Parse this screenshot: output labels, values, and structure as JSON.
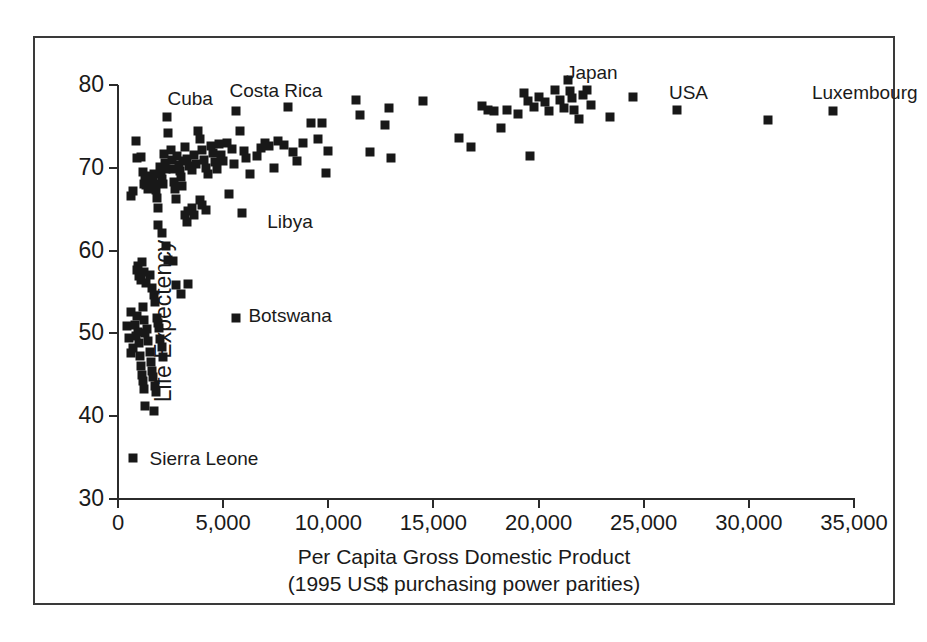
{
  "chart_data": {
    "type": "scatter",
    "title": "",
    "xlabel": "Per Capita Gross Domestic Product",
    "xlabel_sub": "(1995 US$ purchasing power parities)",
    "ylabel": "Life Expectency",
    "xlim": [
      0,
      35000
    ],
    "ylim": [
      30,
      80
    ],
    "xticks": [
      0,
      5000,
      10000,
      15000,
      20000,
      25000,
      30000,
      35000
    ],
    "xtick_labels": [
      "0",
      "5,000",
      "10,000",
      "15,000",
      "20,000",
      "25,000",
      "30,000",
      "35,000"
    ],
    "yticks": [
      30,
      40,
      50,
      60,
      70,
      80
    ],
    "ytick_labels": [
      "30",
      "40",
      "50",
      "60",
      "70",
      "80"
    ],
    "grid": false,
    "legend": false,
    "marker": "square",
    "marker_color": "#181818",
    "annotations": [
      {
        "text": "Japan",
        "x": 21300,
        "y": 81.6
      },
      {
        "text": "Cuba",
        "x": 2350,
        "y": 78.4
      },
      {
        "text": "Costa Rica",
        "x": 5300,
        "y": 79.4
      },
      {
        "text": "USA",
        "x": 26200,
        "y": 79.1
      },
      {
        "text": "Luxembourg",
        "x": 33000,
        "y": 79.1
      },
      {
        "text": "Libya",
        "x": 7100,
        "y": 63.6
      },
      {
        "text": "Botswana",
        "x": 6200,
        "y": 52.2
      },
      {
        "text": "Sierra Leone",
        "x": 1500,
        "y": 35.0
      }
    ],
    "points": [
      [
        600,
        52.6
      ],
      [
        450,
        50.9
      ],
      [
        500,
        49.4
      ],
      [
        700,
        48.2
      ],
      [
        600,
        47.6
      ],
      [
        800,
        51.0
      ],
      [
        850,
        49.7
      ],
      [
        900,
        52.1
      ],
      [
        950,
        50.2
      ],
      [
        1000,
        48.9
      ],
      [
        1050,
        47.3
      ],
      [
        1100,
        46.1
      ],
      [
        1150,
        45.0
      ],
      [
        1200,
        44.2
      ],
      [
        1250,
        43.3
      ],
      [
        1300,
        41.2
      ],
      [
        1700,
        40.6
      ],
      [
        700,
        35.0
      ],
      [
        900,
        57.6
      ],
      [
        950,
        58.1
      ],
      [
        1000,
        56.9
      ],
      [
        1050,
        57.3
      ],
      [
        1100,
        56.4
      ],
      [
        1150,
        58.6
      ],
      [
        1250,
        57.4
      ],
      [
        1350,
        56.1
      ],
      [
        1500,
        57.0
      ],
      [
        1600,
        55.5
      ],
      [
        1700,
        54.6
      ],
      [
        1750,
        53.8
      ],
      [
        1850,
        51.9
      ],
      [
        1900,
        51.2
      ],
      [
        1950,
        50.6
      ],
      [
        2000,
        49.3
      ],
      [
        2100,
        48.4
      ],
      [
        2150,
        47.1
      ],
      [
        1400,
        50.5
      ],
      [
        1450,
        49.1
      ],
      [
        1500,
        47.8
      ],
      [
        1550,
        46.5
      ],
      [
        1600,
        45.4
      ],
      [
        1650,
        44.7
      ],
      [
        1750,
        43.6
      ],
      [
        1800,
        42.9
      ],
      [
        1200,
        53.2
      ],
      [
        1250,
        51.6
      ],
      [
        1300,
        50.0
      ],
      [
        2400,
        58.9
      ],
      [
        2600,
        58.8
      ],
      [
        2750,
        55.9
      ],
      [
        3000,
        54.8
      ],
      [
        3350,
        56.0
      ],
      [
        2100,
        62.1
      ],
      [
        2300,
        60.6
      ],
      [
        1900,
        63.1
      ],
      [
        5600,
        51.9
      ],
      [
        3200,
        64.3
      ],
      [
        3300,
        63.5
      ],
      [
        3350,
        64.8
      ],
      [
        3500,
        65.1
      ],
      [
        3600,
        64.3
      ],
      [
        3900,
        66.1
      ],
      [
        4000,
        65.5
      ],
      [
        4200,
        64.9
      ],
      [
        5300,
        66.8
      ],
      [
        5900,
        64.5
      ],
      [
        600,
        66.6
      ],
      [
        700,
        67.2
      ],
      [
        850,
        73.2
      ],
      [
        900,
        71.2
      ],
      [
        1100,
        71.3
      ],
      [
        1200,
        69.5
      ],
      [
        1250,
        68.0
      ],
      [
        1300,
        68.6
      ],
      [
        1350,
        67.9
      ],
      [
        1400,
        68.4
      ],
      [
        1450,
        67.4
      ],
      [
        1500,
        69.0
      ],
      [
        1550,
        68.2
      ],
      [
        1600,
        67.6
      ],
      [
        1650,
        68.8
      ],
      [
        1700,
        69.3
      ],
      [
        1750,
        68.1
      ],
      [
        1800,
        67.3
      ],
      [
        1850,
        66.4
      ],
      [
        1900,
        65.2
      ],
      [
        2000,
        70.1
      ],
      [
        2050,
        69.4
      ],
      [
        2100,
        68.7
      ],
      [
        2150,
        68.0
      ],
      [
        2200,
        71.7
      ],
      [
        2250,
        70.6
      ],
      [
        2300,
        69.8
      ],
      [
        2350,
        76.1
      ],
      [
        2400,
        74.2
      ],
      [
        2500,
        72.1
      ],
      [
        2550,
        70.9
      ],
      [
        2600,
        69.9
      ],
      [
        2650,
        68.3
      ],
      [
        2700,
        67.5
      ],
      [
        2750,
        66.2
      ],
      [
        2800,
        71.4
      ],
      [
        2900,
        70.3
      ],
      [
        2950,
        69.6
      ],
      [
        3000,
        68.9
      ],
      [
        3050,
        67.8
      ],
      [
        3100,
        70.8
      ],
      [
        3200,
        72.5
      ],
      [
        3300,
        71.1
      ],
      [
        3400,
        70.2
      ],
      [
        3500,
        69.7
      ],
      [
        3600,
        71.6
      ],
      [
        3700,
        70.4
      ],
      [
        3800,
        74.4
      ],
      [
        3900,
        73.5
      ],
      [
        4000,
        72.2
      ],
      [
        4100,
        71.0
      ],
      [
        4200,
        70.0
      ],
      [
        4300,
        69.2
      ],
      [
        4400,
        72.6
      ],
      [
        4500,
        71.8
      ],
      [
        4600,
        70.7
      ],
      [
        4700,
        69.9
      ],
      [
        4800,
        72.9
      ],
      [
        4900,
        71.5
      ],
      [
        5000,
        70.8
      ],
      [
        5200,
        73.0
      ],
      [
        5400,
        72.3
      ],
      [
        5500,
        70.5
      ],
      [
        5600,
        76.8
      ],
      [
        5800,
        74.4
      ],
      [
        6000,
        72.0
      ],
      [
        6100,
        71.2
      ],
      [
        6300,
        69.2
      ],
      [
        6600,
        71.4
      ],
      [
        6800,
        72.4
      ],
      [
        7000,
        73.0
      ],
      [
        7200,
        72.6
      ],
      [
        7400,
        70.0
      ],
      [
        7600,
        73.2
      ],
      [
        7900,
        72.8
      ],
      [
        8100,
        77.3
      ],
      [
        8300,
        71.9
      ],
      [
        8500,
        70.8
      ],
      [
        8800,
        73.0
      ],
      [
        9200,
        75.4
      ],
      [
        9500,
        73.5
      ],
      [
        9700,
        75.4
      ],
      [
        9900,
        69.4
      ],
      [
        10000,
        72.0
      ],
      [
        11300,
        78.2
      ],
      [
        11500,
        76.4
      ],
      [
        12000,
        71.9
      ],
      [
        12700,
        75.2
      ],
      [
        12900,
        77.2
      ],
      [
        13000,
        71.2
      ],
      [
        14500,
        78.1
      ],
      [
        16200,
        73.6
      ],
      [
        16800,
        72.5
      ],
      [
        17300,
        77.5
      ],
      [
        17600,
        77.0
      ],
      [
        17900,
        76.8
      ],
      [
        18200,
        74.8
      ],
      [
        18500,
        77.0
      ],
      [
        19000,
        76.5
      ],
      [
        19300,
        79.0
      ],
      [
        19500,
        78.1
      ],
      [
        19600,
        71.4
      ],
      [
        19800,
        77.3
      ],
      [
        20000,
        78.6
      ],
      [
        20300,
        77.9
      ],
      [
        20500,
        76.8
      ],
      [
        20800,
        79.4
      ],
      [
        21000,
        78.2
      ],
      [
        21200,
        77.2
      ],
      [
        21400,
        80.6
      ],
      [
        21500,
        79.3
      ],
      [
        21600,
        78.4
      ],
      [
        21700,
        77.0
      ],
      [
        21900,
        75.9
      ],
      [
        22100,
        78.8
      ],
      [
        22300,
        79.4
      ],
      [
        22500,
        77.6
      ],
      [
        23400,
        76.1
      ],
      [
        24500,
        78.6
      ],
      [
        26600,
        77.0
      ],
      [
        30900,
        75.8
      ],
      [
        34000,
        76.8
      ],
      [
        38700,
        78.2
      ]
    ]
  }
}
